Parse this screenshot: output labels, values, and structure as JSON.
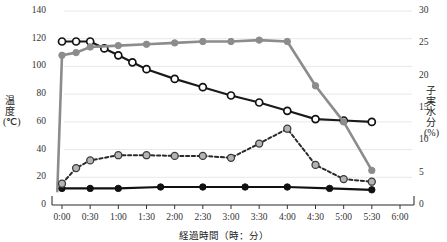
{
  "chart_data": {
    "type": "line",
    "title": "",
    "xlabel": "経過時間（時：分）",
    "ylabel": "温度（℃)",
    "ylabel_right": "子実水分（%)",
    "x": [
      "0:00",
      "0:30",
      "1:00",
      "1:30",
      "2:00",
      "2:30",
      "3:00",
      "3:30",
      "4:00",
      "4:30",
      "5:00",
      "5:30",
      "6:00"
    ],
    "x_ticks": [
      "0:00",
      "0:30",
      "1:00",
      "1:30",
      "2:00",
      "2:30",
      "3:00",
      "3:30",
      "4:00",
      "4:30",
      "5:00",
      "5:30",
      "6:00"
    ],
    "y_ticks_left": [
      0,
      20,
      40,
      60,
      80,
      100,
      120,
      140
    ],
    "y_ticks_right": [
      0,
      5,
      10,
      15,
      20,
      25,
      30
    ],
    "ylim": [
      0,
      140
    ],
    "ylim_right": [
      0,
      30
    ],
    "grid": true,
    "legend": "none",
    "series": [
      {
        "name": "temp-open-circle-black",
        "axis": "left",
        "color": "#1a1a1a",
        "marker": "open-circle",
        "linestyle": "solid",
        "x": [
          "0:00",
          "0:15",
          "0:30",
          "0:45",
          "1:00",
          "1:15",
          "1:30",
          "2:00",
          "2:30",
          "3:00",
          "3:30",
          "4:00",
          "4:30",
          "5:00",
          "5:30"
        ],
        "values": [
          118,
          118,
          118,
          113,
          108,
          103,
          98,
          91,
          85,
          79,
          74,
          68,
          62,
          61,
          60
        ]
      },
      {
        "name": "temp-filled-gray-solid",
        "axis": "left",
        "color": "#8c8c8c",
        "marker": "filled-circle",
        "linestyle": "solid",
        "x": [
          "-0:05",
          "0:00",
          "0:15",
          "0:30",
          "1:00",
          "1:30",
          "2:00",
          "2:30",
          "3:00",
          "3:30",
          "4:00",
          "4:30",
          "5:00",
          "5:30"
        ],
        "values": [
          10,
          108,
          110,
          114,
          115,
          116,
          117,
          118,
          118,
          119,
          118,
          86,
          60,
          25
        ]
      },
      {
        "name": "temp-filled-black-flat",
        "axis": "left",
        "color": "#111111",
        "marker": "filled-circle",
        "linestyle": "solid",
        "x": [
          "0:00",
          "0:30",
          "1:00",
          "1:45",
          "2:30",
          "3:15",
          "4:00",
          "4:45",
          "5:30"
        ],
        "values": [
          12,
          12,
          12,
          13,
          13,
          13,
          13,
          12,
          11
        ]
      },
      {
        "name": "moisture-dashed-gray",
        "axis": "right",
        "color": "#2a2a2a",
        "marker": "gray-circle",
        "linestyle": "dashed",
        "x": [
          "0:00",
          "0:15",
          "0:30",
          "1:00",
          "1:30",
          "2:00",
          "2:30",
          "3:00",
          "3:30",
          "4:00",
          "4:30",
          "5:00",
          "5:30"
        ],
        "values": [
          3.3,
          5.7,
          6.9,
          7.7,
          7.7,
          7.6,
          7.6,
          7.3,
          9.5,
          11.8,
          6.2,
          4.0,
          3.6
        ]
      }
    ]
  },
  "axes": {
    "left_title_lines": [
      "温",
      "度",
      "(℃)"
    ],
    "right_title_lines": [
      "子",
      "実",
      "水",
      "分",
      "(%)"
    ]
  }
}
